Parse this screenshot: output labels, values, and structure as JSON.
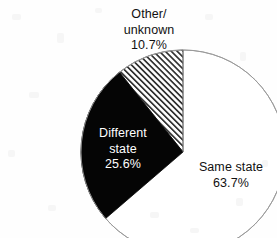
{
  "chart_data": {
    "type": "pie",
    "title": "",
    "subtitle": "",
    "xlabel": "",
    "ylabel": "",
    "legend_position": "none",
    "grid": false,
    "units": "percent",
    "start_angle_deg": 0,
    "direction": "clockwise",
    "categories": [
      "Same state",
      "Different state",
      "Other/unknown"
    ],
    "values": [
      63.7,
      25.6,
      10.7
    ],
    "slices": [
      {
        "name": "Same state",
        "value": 63.7,
        "value_label": "63.7%",
        "label_line1": "Same state",
        "label_line2": "63.7%",
        "fill": "white",
        "fill_color": "#ffffff",
        "stroke_color": "#8a8a8a",
        "label_color": "#111111",
        "label_placement": "outside-right"
      },
      {
        "name": "Different state",
        "value": 25.6,
        "value_label": "25.6%",
        "label_line1": "Different",
        "label_line2": "state",
        "label_line3": "25.6%",
        "fill": "solid-black",
        "fill_color": "#050505",
        "stroke_color": "#050505",
        "label_color": "#ffffff",
        "label_placement": "inside"
      },
      {
        "name": "Other/unknown",
        "value": 10.7,
        "value_label": "10.7%",
        "label_line1": "Other/",
        "label_line2": "unknown",
        "label_line3": "10.7%",
        "fill": "diagonal-hatch",
        "fill_color": "#ffffff",
        "hatch_color": "#3a3a3a",
        "stroke_color": "#6e6e6e",
        "label_color": "#111111",
        "label_placement": "outside-top"
      }
    ],
    "geometry": {
      "center_x": 183,
      "center_y": 152,
      "radius": 102
    },
    "background_color": "#ffffff"
  }
}
